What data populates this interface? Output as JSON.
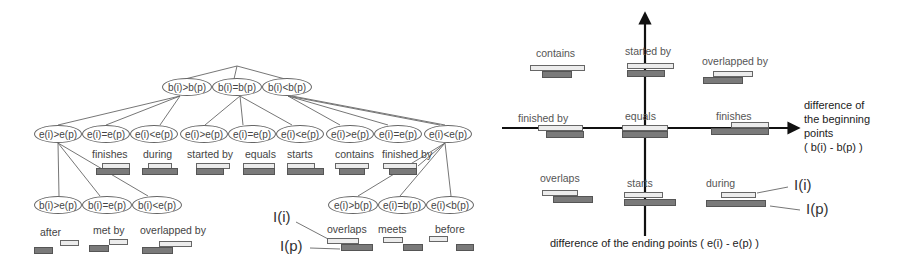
{
  "tree": {
    "level1": [
      "b(i)>b(p)",
      "b(i)=b(p)",
      "b(i)<b(p)"
    ],
    "level2": [
      "e(i)>e(p)",
      "e(i)=e(p)",
      "e(i)<e(p)",
      "e(i)>e(p)",
      "e(i)=e(p)",
      "e(i)<e(p)",
      "e(i)>e(p)",
      "e(i)=e(p)",
      "e(i)<e(p)"
    ],
    "level3_left": [
      "b(i)>e(p)",
      "b(i)=e(p)",
      "b(i)<e(p)"
    ],
    "level3_right": [
      "e(i)>b(p)",
      "e(i)=b(p)",
      "e(i)<b(p)"
    ],
    "relations_mid": [
      "finishes",
      "during",
      "started by",
      "equals",
      "starts",
      "contains",
      "finished by"
    ],
    "relations_left": [
      "after",
      "met by",
      "overlapped by"
    ],
    "relations_right": [
      "overlaps",
      "meets",
      "before"
    ],
    "legend": {
      "interval_i": "I(i)",
      "interval_p": "I(p)"
    }
  },
  "plane": {
    "quadrant_labels": {
      "contains": "contains",
      "started_by": "started by",
      "overlapped_by": "overlapped by",
      "finished_by": "finished by",
      "equals": "equals",
      "finishes": "finishes",
      "overlaps": "overlaps",
      "starts": "starts",
      "during": "during"
    },
    "x_axis_label": [
      "difference of",
      "the beginning",
      "points",
      "( b(i) - b(p) )"
    ],
    "y_axis_label": "difference of the ending points ( e(i) - e(p) )",
    "legend": {
      "interval_i": "I(i)",
      "interval_p": "I(p)"
    }
  },
  "colors": {
    "interval_i": "#ececec",
    "interval_p": "#7a7a7a",
    "line": "#666666",
    "axis": "#111111"
  }
}
